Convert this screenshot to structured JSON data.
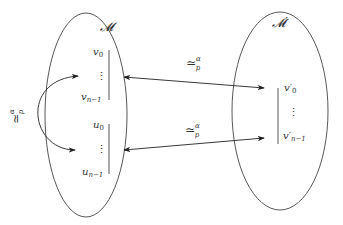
{
  "diagram": {
    "left_set": {
      "label": "𝓜",
      "group_v": {
        "first": "v",
        "first_sub": "0",
        "dots": "⋮",
        "last": "v",
        "last_sub": "n−1"
      },
      "group_u": {
        "first": "u",
        "first_sub": "0",
        "dots": "⋮",
        "last": "u",
        "last_sub": "n−1"
      }
    },
    "right_set": {
      "label": "𝓜′",
      "group_v_prime": {
        "first": "v′",
        "first_sub": "0",
        "dots": "⋮",
        "last": "v′",
        "last_sub": "n−1"
      }
    },
    "relations": {
      "upper_arrow": {
        "symbol": "≃",
        "sub": "p",
        "sup": "α"
      },
      "lower_arrow": {
        "symbol": "≃",
        "sub": "p",
        "sup": "α"
      },
      "left_curved_arrow": {
        "symbol": "≃",
        "sub": "p",
        "sup": "α"
      }
    }
  }
}
